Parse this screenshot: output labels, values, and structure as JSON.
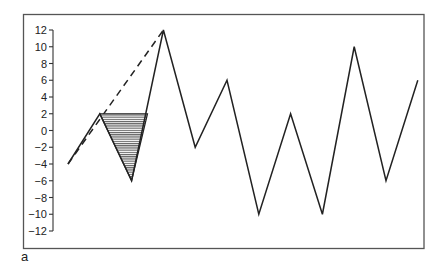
{
  "panel_label": "a",
  "chart_data": {
    "type": "line",
    "title": "",
    "xlabel": "",
    "ylabel": "",
    "ylim": [
      -12,
      12
    ],
    "yticks": [
      12,
      10,
      8,
      6,
      4,
      2,
      0,
      -2,
      -4,
      -6,
      -8,
      -10,
      -12
    ],
    "ytick_labels": [
      "12",
      "10",
      "8",
      "6",
      "4",
      "2",
      "0",
      "-2",
      "-4",
      "-6",
      "-8",
      "-10",
      "-12"
    ],
    "grid": false,
    "x": [
      1,
      2,
      3,
      4,
      5,
      6,
      7,
      8,
      9,
      10,
      11,
      12
    ],
    "series": [
      {
        "name": "zigzag",
        "style": "solid",
        "values": [
          -4,
          2,
          -6,
          12,
          -2,
          6,
          -10,
          2,
          -10,
          10,
          -6,
          6
        ]
      }
    ],
    "annotations": [
      {
        "type": "dashed-line",
        "from": {
          "x": 1,
          "y": -4
        },
        "to": {
          "x": 4,
          "y": 12
        }
      },
      {
        "type": "hatched-triangle",
        "points": [
          {
            "x": 2,
            "y": 2
          },
          {
            "x": 3.5,
            "y": 2
          },
          {
            "x": 3,
            "y": -6
          }
        ]
      }
    ]
  }
}
